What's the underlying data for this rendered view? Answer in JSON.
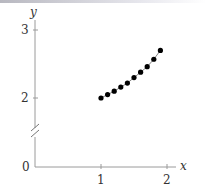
{
  "chart_data": {
    "type": "scatter",
    "title": "",
    "xlabel": "x",
    "ylabel": "y",
    "x": [
      1.0,
      1.1,
      1.2,
      1.3,
      1.4,
      1.5,
      1.6,
      1.7,
      1.8,
      1.9
    ],
    "y": [
      2.0,
      2.05,
      2.1,
      2.16,
      2.22,
      2.3,
      2.38,
      2.46,
      2.57,
      2.7
    ],
    "connected": true,
    "x_ticks": [
      "1",
      "2"
    ],
    "y_ticks": [
      "0",
      "2",
      "3"
    ],
    "xlim": [
      0,
      2.1
    ],
    "ylim": [
      0,
      3.1
    ],
    "y_axis_break": true,
    "grid": false,
    "legend": null
  },
  "axes": {
    "x_label": "x",
    "y_label": "y",
    "origin_label": "0",
    "x_tick_1": "1",
    "x_tick_2": "2",
    "y_tick_2": "2",
    "y_tick_3": "3"
  },
  "colors": {
    "axis": "#999999",
    "points": "#000000",
    "text": "#333333"
  }
}
